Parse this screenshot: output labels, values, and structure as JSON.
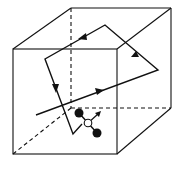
{
  "diagram": {
    "type": "random-walk-in-box",
    "colors": {
      "stroke": "#111111",
      "background": "#ffffff",
      "molecule_atom": "#111111",
      "molecule_center": "#ffffff"
    },
    "cube": {
      "front_face": {
        "x1": 13,
        "y1": 49,
        "x2": 117,
        "y2": 154
      },
      "back_face": {
        "x1": 71,
        "y1": 8,
        "x2": 171,
        "y2": 108
      },
      "hidden_edges": "dashed"
    },
    "trajectory": {
      "points": [
        [
          36,
          115
        ],
        [
          158,
          70
        ],
        [
          105,
          25
        ],
        [
          45,
          59
        ],
        [
          73,
          134
        ],
        [
          82,
          124
        ]
      ],
      "arrows": 4
    },
    "molecule": {
      "center": [
        88,
        123
      ],
      "atoms": [
        [
          79,
          113
        ],
        [
          97,
          133
        ]
      ],
      "velocity_arrow_tip": [
        100,
        112
      ]
    }
  }
}
